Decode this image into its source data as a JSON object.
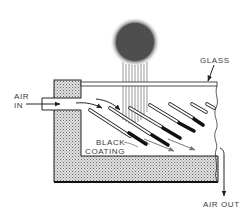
{
  "diagram": {
    "labels": {
      "glass": "GLASS",
      "air_in_line1": "AIR",
      "air_in_line2": "IN",
      "black_line1": "BLACK",
      "black_line2": "COATING",
      "air_out": "AIR OUT"
    },
    "components": [
      "sun",
      "sun-rays",
      "glass-cover",
      "insulation",
      "inlet-duct",
      "absorber-plates",
      "outlet-arrow"
    ],
    "plate_count": 7,
    "colors": {
      "line": "#2a2a2a",
      "sun": "#4a4a4a",
      "insulation": "#bdbdbd",
      "background": "#ffffff"
    }
  }
}
